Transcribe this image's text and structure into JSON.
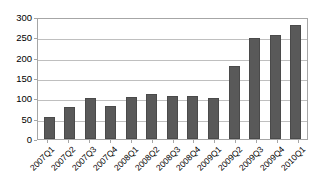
{
  "chart_data": {
    "type": "bar",
    "title": "",
    "subtitle": "",
    "xlabel": "",
    "ylabel": "",
    "categories": [
      "2007Q1",
      "2007Q2",
      "2007Q3",
      "2007Q4",
      "2008Q1",
      "2008Q2",
      "2008Q3",
      "2008Q4",
      "2009Q1",
      "2009Q2",
      "2009Q3",
      "2009Q4",
      "2010Q1"
    ],
    "values": [
      55,
      78,
      100,
      80,
      103,
      110,
      105,
      105,
      102,
      180,
      248,
      256,
      280
    ],
    "series": [
      {
        "name": "",
        "values": [
          55,
          78,
          100,
          80,
          103,
          110,
          105,
          105,
          102,
          180,
          248,
          256,
          280
        ]
      }
    ],
    "ylim": [
      0,
      300
    ],
    "xlim": [
      0,
      13
    ],
    "yticks": [
      0,
      50,
      100,
      150,
      200,
      250,
      300
    ],
    "ytick_labels": [
      "0",
      "50",
      "100",
      "150",
      "200",
      "250",
      "300"
    ],
    "grid": true,
    "grid_axis": "y",
    "legend": false,
    "legend_position": "none",
    "annotations": [],
    "bar_color": "#595959",
    "grid_color": "#bfbfbf",
    "axis_color": "#a6a6a6",
    "background_color": "#ffffff",
    "xtick_label_rotation": -45
  }
}
